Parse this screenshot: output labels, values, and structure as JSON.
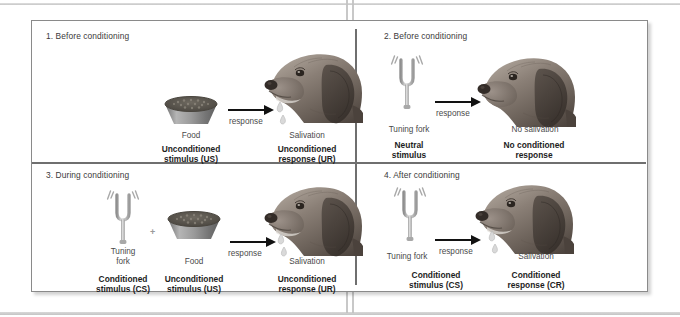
{
  "figure": {
    "panels": [
      {
        "id": "panel-1",
        "heading": "1. Before conditioning",
        "arrow_label": "response",
        "stimulus_plain": "Food",
        "stimulus_bold": "Unconditioned\nstimulus (US)",
        "stimulus_bold_line1": "Unconditioned",
        "stimulus_bold_line2": "stimulus (US)",
        "response_plain": "Salivation",
        "response_bold_line1": "Unconditioned",
        "response_bold_line2": "response (UR)",
        "has_bowl": true,
        "has_fork": false,
        "has_drops": true,
        "plus": ""
      },
      {
        "id": "panel-2",
        "heading": "2. Before conditioning",
        "arrow_label": "response",
        "stimulus_plain": "Tuning fork",
        "stimulus_bold_line1": "Neutral",
        "stimulus_bold_line2": "stimulus",
        "response_plain": "No salivation",
        "response_bold_line1": "No conditioned",
        "response_bold_line2": "response",
        "has_bowl": false,
        "has_fork": true,
        "has_drops": false,
        "plus": ""
      },
      {
        "id": "panel-3",
        "heading": "3. During conditioning",
        "arrow_label": "response",
        "fork_plain_line1": "Tuning",
        "fork_plain_line2": "fork",
        "fork_bold_line1": "Conditioned",
        "fork_bold_line2": "stimulus (CS)",
        "stimulus_plain": "Food",
        "stimulus_bold_line1": "Unconditioned",
        "stimulus_bold_line2": "stimulus (US)",
        "response_plain": "Salivation",
        "response_bold_line1": "Unconditioned",
        "response_bold_line2": "response (UR)",
        "has_bowl": true,
        "has_fork": true,
        "has_drops": true,
        "plus": "+"
      },
      {
        "id": "panel-4",
        "heading": "4. After conditioning",
        "arrow_label": "response",
        "stimulus_plain": "Tuning fork",
        "stimulus_bold_line1": "Conditioned",
        "stimulus_bold_line2": "stimulus (CS)",
        "response_plain": "Salivation",
        "response_bold_line1": "Conditioned",
        "response_bold_line2": "response (CR)",
        "has_bowl": false,
        "has_fork": true,
        "has_drops": true,
        "plus": ""
      }
    ],
    "colors": {
      "page_background": "#ffffff",
      "frame_border": "#8a8a8a",
      "divider": "#6f6f6f",
      "arrow": "#121212",
      "bold_text": "#1d1d1d",
      "plain_text": "#4a4a4a",
      "heading_text": "#3a3a3a",
      "dog_fur_dark": "#5d544d",
      "dog_fur_mid": "#837870",
      "dog_fur_light": "#a99e95",
      "bowl_body": "#8d8d8d",
      "bowl_food": "#595550",
      "fork_metal": "#b9b9b9",
      "saliva": "#d5d5d5"
    }
  }
}
